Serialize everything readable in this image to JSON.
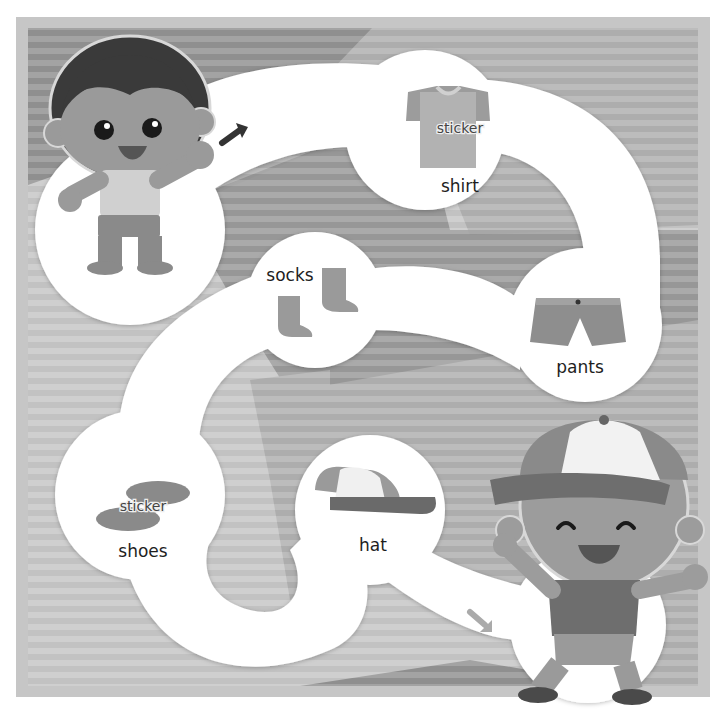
{
  "puzzle": {
    "items": [
      {
        "id": "shirt",
        "label": "shirt",
        "sticker": "sticker"
      },
      {
        "id": "pants",
        "label": "pants"
      },
      {
        "id": "socks",
        "label": "socks"
      },
      {
        "id": "shoes",
        "label": "shoes",
        "sticker": "sticker"
      },
      {
        "id": "hat",
        "label": "hat"
      }
    ],
    "start_character": "boy in undershirt",
    "end_character": "dressed boy with cap"
  },
  "colors": {
    "frame": "#c9c9c9",
    "stripe_dark": "#9a9a9a",
    "stripe_light": "#b0b0b0",
    "path": "#ffffff",
    "label_text": "#1e1e1e"
  }
}
